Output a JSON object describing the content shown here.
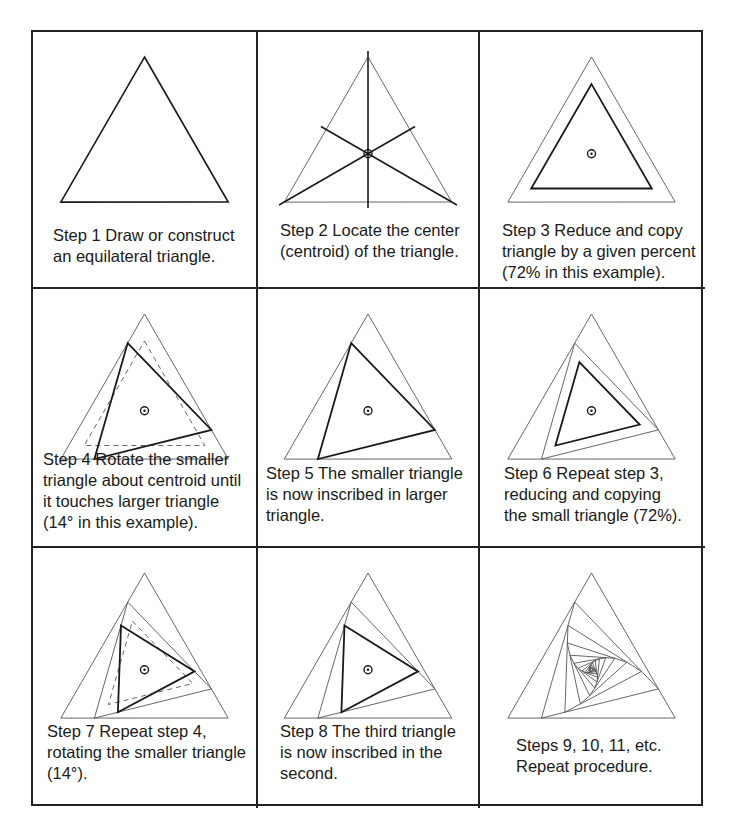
{
  "figure": {
    "scale_percent": 72,
    "rotation_degrees": 14,
    "colors": {
      "border": "#222222",
      "thin_line": "#555555",
      "thick_line": "#1a1a1a",
      "text": "#1a1a1a",
      "background": "#ffffff"
    }
  },
  "panels": [
    {
      "id": "step1",
      "caption": "Step 1  Draw or construct\nan equilateral triangle.",
      "caption_x": 20,
      "caption_y": 193,
      "drawing": "outer_only"
    },
    {
      "id": "step2",
      "caption": "Step 2  Locate the center\n(centroid) of the triangle.",
      "caption_x": 22,
      "caption_y": 188,
      "drawing": "medians"
    },
    {
      "id": "step3",
      "caption": "Step 3  Reduce and copy\ntriangle by a given percent\n(72% in this example).",
      "caption_x": 22,
      "caption_y": 188,
      "drawing": "reduced"
    },
    {
      "id": "step4",
      "caption": "Step 4  Rotate the smaller\ntriangle about centroid until\nit touches larger triangle\n(14° in this example).",
      "caption_x": 10,
      "caption_y": 160,
      "drawing": "rotate_dashed"
    },
    {
      "id": "step5",
      "caption": "Step 5  The smaller triangle\nis now inscribed in larger\ntriangle.",
      "caption_x": 8,
      "caption_y": 174,
      "drawing": "inscribed"
    },
    {
      "id": "step6",
      "caption": "Step 6  Repeat step 3,\nreducing and copying\nthe small triangle (72%).",
      "caption_x": 24,
      "caption_y": 174,
      "drawing": "second_reduced"
    },
    {
      "id": "step7",
      "caption": "Step 7  Repeat step 4,\nrotating the smaller triangle\n(14°).",
      "caption_x": 14,
      "caption_y": 173,
      "drawing": "second_rotate_dashed"
    },
    {
      "id": "step8",
      "caption": "Step 8  The third triangle\nis now inscribed in the\nsecond.",
      "caption_x": 22,
      "caption_y": 173,
      "drawing": "third_inscribed"
    },
    {
      "id": "step9",
      "caption": "Steps 9, 10, 11, etc.\nRepeat procedure.",
      "caption_x": 36,
      "caption_y": 187,
      "drawing": "spiral"
    }
  ]
}
